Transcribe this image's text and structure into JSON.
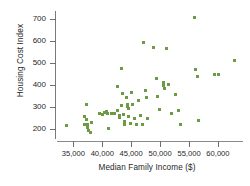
{
  "chart_data": {
    "type": "scatter",
    "title": "",
    "xlabel": "Median Family Income ($)",
    "ylabel": "Housing Cost Index",
    "xlim": [
      32000,
      64500
    ],
    "ylim": [
      160,
      730
    ],
    "grid": false,
    "legend": null,
    "marker_color": "#6d9b43",
    "marker_shape": "square",
    "xticks": [
      35000,
      40000,
      45000,
      50000,
      55000,
      60000
    ],
    "xticklabels": [
      "35,000",
      "40,000",
      "45,000",
      "50,000",
      "55,000",
      "60,000"
    ],
    "yticks": [
      200,
      300,
      400,
      500,
      600,
      700
    ],
    "yticklabels": [
      "200",
      "300",
      "400",
      "500",
      "600",
      "700"
    ],
    "points": [
      {
        "x": 33800,
        "y": 216
      },
      {
        "x": 37300,
        "y": 313
      },
      {
        "x": 37000,
        "y": 258
      },
      {
        "x": 37200,
        "y": 243
      },
      {
        "x": 37000,
        "y": 222
      },
      {
        "x": 37500,
        "y": 219
      },
      {
        "x": 37400,
        "y": 206
      },
      {
        "x": 37700,
        "y": 193
      },
      {
        "x": 37900,
        "y": 186
      },
      {
        "x": 38200,
        "y": 230
      },
      {
        "x": 39500,
        "y": 271
      },
      {
        "x": 40100,
        "y": 268
      },
      {
        "x": 40700,
        "y": 278
      },
      {
        "x": 40400,
        "y": 276
      },
      {
        "x": 40900,
        "y": 272
      },
      {
        "x": 41100,
        "y": 203
      },
      {
        "x": 41600,
        "y": 269
      },
      {
        "x": 42100,
        "y": 270
      },
      {
        "x": 42600,
        "y": 393
      },
      {
        "x": 42700,
        "y": 285
      },
      {
        "x": 42900,
        "y": 264
      },
      {
        "x": 43000,
        "y": 253
      },
      {
        "x": 43300,
        "y": 473
      },
      {
        "x": 43500,
        "y": 360
      },
      {
        "x": 43400,
        "y": 309
      },
      {
        "x": 43600,
        "y": 268
      },
      {
        "x": 43800,
        "y": 236
      },
      {
        "x": 43900,
        "y": 219
      },
      {
        "x": 44200,
        "y": 341
      },
      {
        "x": 44300,
        "y": 311
      },
      {
        "x": 44400,
        "y": 304
      },
      {
        "x": 44600,
        "y": 292
      },
      {
        "x": 44500,
        "y": 258
      },
      {
        "x": 44800,
        "y": 226
      },
      {
        "x": 45100,
        "y": 365
      },
      {
        "x": 45300,
        "y": 313
      },
      {
        "x": 45600,
        "y": 248
      },
      {
        "x": 45900,
        "y": 219
      },
      {
        "x": 46300,
        "y": 331
      },
      {
        "x": 46600,
        "y": 262
      },
      {
        "x": 46900,
        "y": 222
      },
      {
        "x": 47200,
        "y": 594
      },
      {
        "x": 47400,
        "y": 374
      },
      {
        "x": 47600,
        "y": 345
      },
      {
        "x": 47900,
        "y": 246
      },
      {
        "x": 48900,
        "y": 571
      },
      {
        "x": 49300,
        "y": 431
      },
      {
        "x": 49600,
        "y": 348
      },
      {
        "x": 49900,
        "y": 291
      },
      {
        "x": 50600,
        "y": 397
      },
      {
        "x": 50500,
        "y": 411
      },
      {
        "x": 50800,
        "y": 382
      },
      {
        "x": 51100,
        "y": 563
      },
      {
        "x": 51500,
        "y": 401
      },
      {
        "x": 51900,
        "y": 269
      },
      {
        "x": 52700,
        "y": 355
      },
      {
        "x": 53100,
        "y": 286
      },
      {
        "x": 53600,
        "y": 223
      },
      {
        "x": 55900,
        "y": 707
      },
      {
        "x": 56100,
        "y": 471
      },
      {
        "x": 56400,
        "y": 440
      },
      {
        "x": 56600,
        "y": 240
      },
      {
        "x": 59400,
        "y": 447
      },
      {
        "x": 60100,
        "y": 447
      },
      {
        "x": 62800,
        "y": 512
      }
    ]
  }
}
